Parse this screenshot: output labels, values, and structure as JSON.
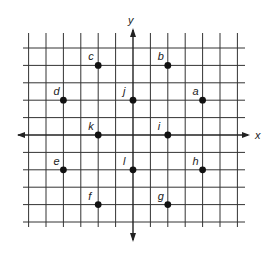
{
  "diagram": {
    "type": "coordinate-grid",
    "axes": {
      "x_label": "x",
      "y_label": "y"
    },
    "grid": {
      "x_range": [
        -6,
        6
      ],
      "y_range": [
        -5,
        5
      ],
      "origin_px": [
        133,
        135
      ],
      "step_px": 17.4
    },
    "colors": {
      "line": "#222222",
      "point": "#111111",
      "background": "#ffffff"
    },
    "points": [
      {
        "label": "a",
        "x": 4,
        "y": 2
      },
      {
        "label": "b",
        "x": 2,
        "y": 4
      },
      {
        "label": "c",
        "x": -2,
        "y": 4
      },
      {
        "label": "d",
        "x": -4,
        "y": 2
      },
      {
        "label": "e",
        "x": -4,
        "y": -2
      },
      {
        "label": "f",
        "x": -2,
        "y": -4
      },
      {
        "label": "g",
        "x": 2,
        "y": -4
      },
      {
        "label": "h",
        "x": 4,
        "y": -2
      },
      {
        "label": "i",
        "x": 2,
        "y": 0
      },
      {
        "label": "j",
        "x": 0,
        "y": 2
      },
      {
        "label": "k",
        "x": -2,
        "y": 0
      },
      {
        "label": "l",
        "x": 0,
        "y": -2
      }
    ]
  }
}
